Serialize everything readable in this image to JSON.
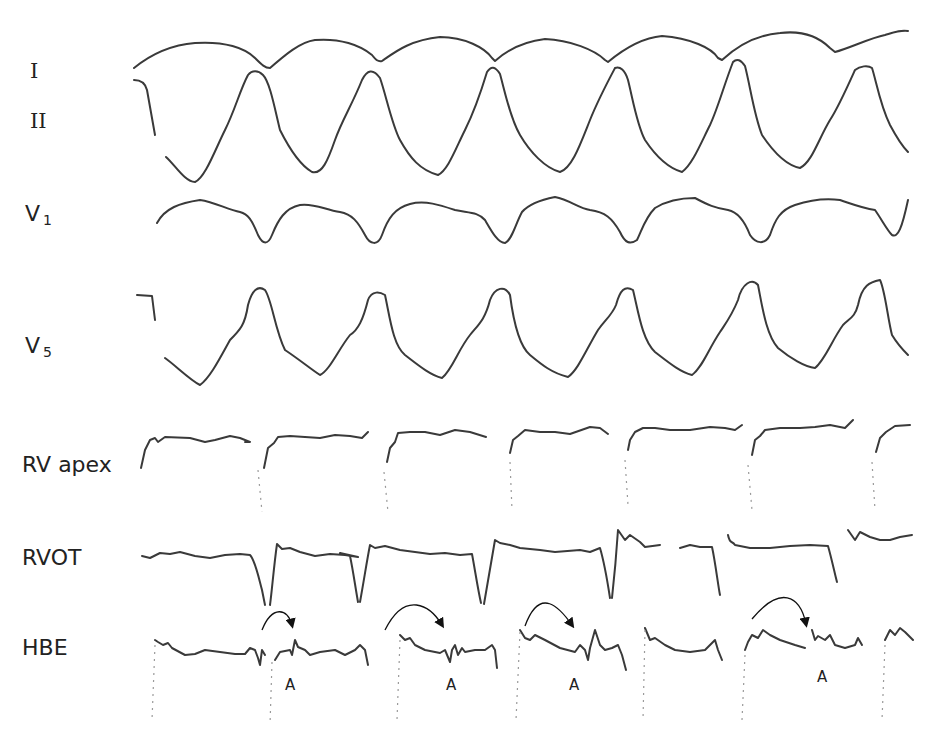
{
  "figure": {
    "type": "intracardiac electrogram with surface ECG",
    "leads": [
      {
        "id": "I",
        "label": "I",
        "subscript": ""
      },
      {
        "id": "II",
        "label": "II",
        "subscript": ""
      },
      {
        "id": "V1",
        "label": "V",
        "subscript": "1"
      },
      {
        "id": "V5",
        "label": "V",
        "subscript": "5"
      },
      {
        "id": "RVapex",
        "label": "RV apex",
        "subscript": ""
      },
      {
        "id": "RVOT",
        "label": "RVOT",
        "subscript": ""
      },
      {
        "id": "HBE",
        "label": "HBE",
        "subscript": ""
      }
    ],
    "annotations": [
      {
        "text": "A",
        "target": "HBE",
        "beat": 2
      },
      {
        "text": "A",
        "target": "HBE",
        "beat": 3
      },
      {
        "text": "A",
        "target": "HBE",
        "beat": 4
      },
      {
        "text": "A",
        "target": "HBE",
        "beat": 6
      }
    ],
    "beats_visible": 6,
    "colors": {
      "trace": "#3a3a3a",
      "background": "#ffffff",
      "label": "#222222"
    }
  }
}
